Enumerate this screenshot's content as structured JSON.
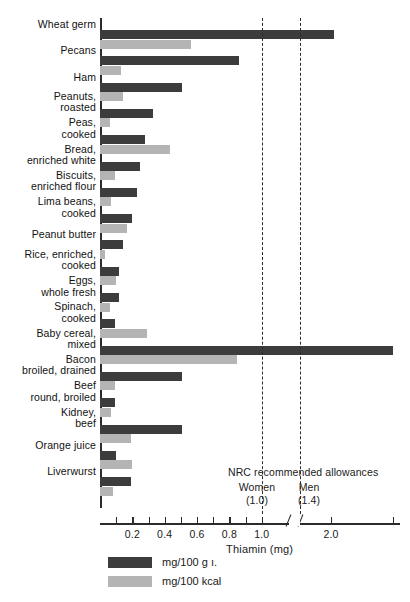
{
  "chart_data": {
    "type": "bar",
    "title": "",
    "xlabel": "Thiamin (mg)",
    "ylabel": "",
    "orientation": "horizontal",
    "grid": false,
    "legend_position": "bottom-left",
    "axis_break": true,
    "xlim": [
      0,
      3.0
    ],
    "xticks": [
      0.1,
      0.2,
      0.3,
      0.4,
      0.5,
      0.6,
      0.7,
      0.8,
      0.9,
      1.0,
      1.5,
      2.0,
      2.9
    ],
    "xticklabels": [
      "",
      "0.2",
      "",
      "0.4",
      "",
      "0.6",
      "",
      "0.8",
      "",
      "1.0",
      "",
      "2.0",
      ""
    ],
    "categories": [
      "Wheat germ",
      "Pecans",
      "Ham",
      "Peanuts,\nroasted",
      "Peas,\ncooked",
      "Bread,\nenriched white",
      "Biscuits,\nenriched flour",
      "Lima beans,\ncooked",
      "Peanut butter",
      "Rice, enriched,\ncooked",
      "Eggs,\nwhole fresh",
      "Spinach,\ncooked",
      "Baby cereal,\nmixed",
      "Bacon\nbroiled, drained",
      "Beef\nround, broiled",
      "Kidney,\nbeef",
      "Orange juice",
      "Liverwurst"
    ],
    "series": [
      {
        "name": "mg/100 g.",
        "color": "#3c3c3c",
        "values": [
          2.05,
          0.86,
          0.51,
          0.33,
          0.28,
          0.25,
          0.23,
          0.2,
          0.14,
          0.12,
          0.12,
          0.09,
          2.9,
          0.51,
          0.09,
          0.51,
          0.1,
          0.19
        ]
      },
      {
        "name": "mg/100 kcal",
        "color": "#b4b4b4",
        "values": [
          0.56,
          0.13,
          0.14,
          0.06,
          0.43,
          0.09,
          0.07,
          0.17,
          0.03,
          0.1,
          0.06,
          0.29,
          0.85,
          0.09,
          0.07,
          0.19,
          0.2,
          0.08
        ]
      }
    ],
    "annotations": {
      "heading": "NRC recommended allowances",
      "markers": [
        {
          "label": "Women",
          "value_label": "(1.0)",
          "value": 1.0
        },
        {
          "label": "Men",
          "value_label": "(1.4)",
          "value": 1.4
        }
      ]
    }
  },
  "legend": {
    "items": [
      {
        "label": "mg/100 g ı.",
        "color": "#3c3c3c"
      },
      {
        "label": "mg/100 kcal",
        "color": "#b4b4b4"
      }
    ]
  }
}
